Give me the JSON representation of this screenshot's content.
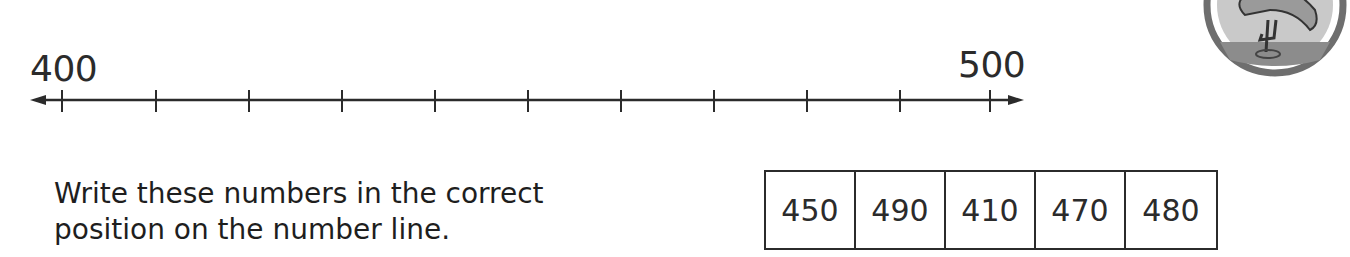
{
  "number_line": {
    "start_label": "400",
    "end_label": "500",
    "min": 400,
    "max": 500,
    "tick_count": 11,
    "tick_interval": 10,
    "tick_x": [
      62,
      156,
      249,
      342,
      435,
      528,
      621,
      714,
      807,
      900,
      990
    ]
  },
  "instruction": {
    "line1": "Write these numbers in the correct",
    "line2": "position on the number line."
  },
  "number_box": {
    "values": [
      "450",
      "490",
      "410",
      "470",
      "480"
    ]
  },
  "badge": {
    "icon": "flamingo-icon"
  }
}
